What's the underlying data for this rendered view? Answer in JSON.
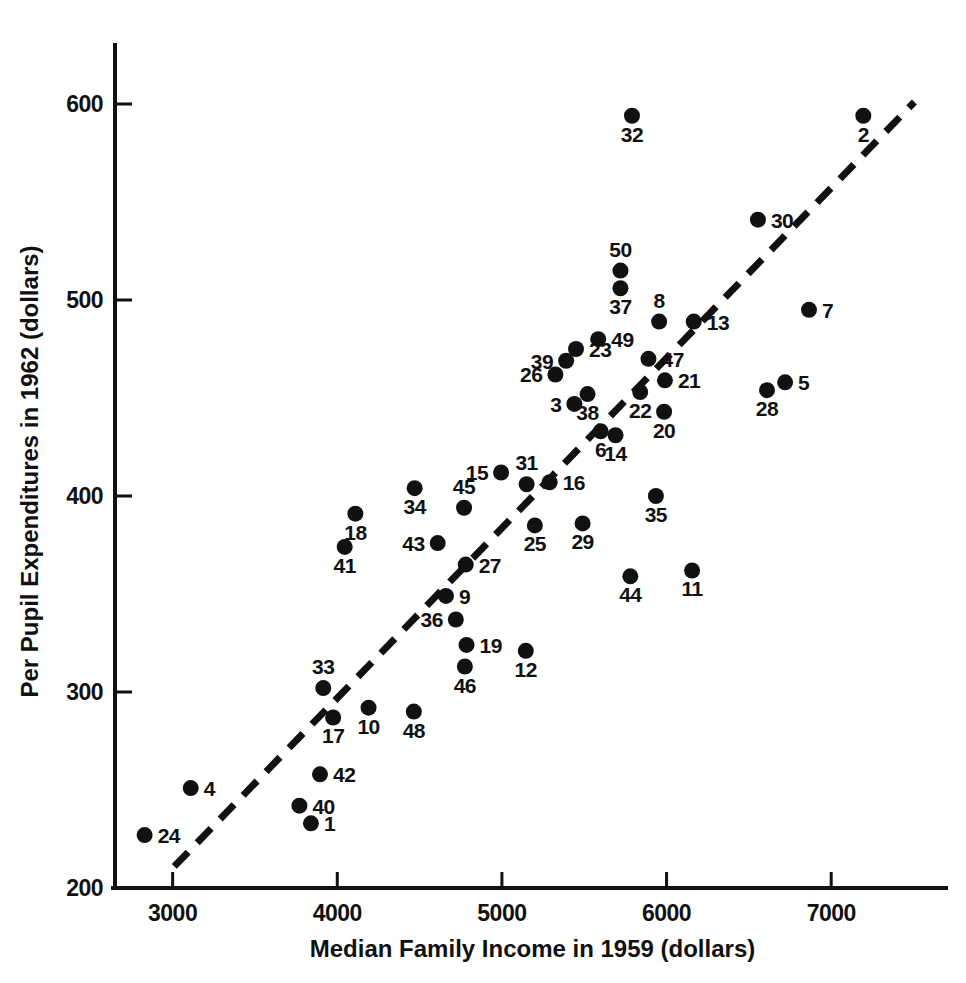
{
  "chart_data": {
    "type": "scatter",
    "title": "",
    "xlabel": "Median Family Income in 1959 (dollars)",
    "ylabel": "Per Pupil Expenditures in 1962 (dollars)",
    "xlim": [
      2650,
      7600
    ],
    "ylim": [
      200,
      625
    ],
    "xticks": [
      3000,
      4000,
      5000,
      6000,
      7000
    ],
    "yticks": [
      200,
      300,
      400,
      500,
      600
    ],
    "xtick_labels": [
      "3000",
      "4000",
      "5000",
      "6000",
      "7000"
    ],
    "ytick_labels": [
      "200",
      "300",
      "400",
      "500",
      "600"
    ],
    "grid": false,
    "legend": "none",
    "marker": "filled-circle",
    "point_label_field": "state_number",
    "fit_line": {
      "style": "dashed",
      "x_start": 3010,
      "y_start": 211,
      "x_end": 7505,
      "y_end": 601
    },
    "points": [
      {
        "label": "24",
        "x": 2830,
        "y": 227
      },
      {
        "label": "4",
        "x": 3110,
        "y": 251
      },
      {
        "label": "40",
        "x": 3770,
        "y": 242
      },
      {
        "label": "1",
        "x": 3840,
        "y": 233
      },
      {
        "label": "42",
        "x": 3895,
        "y": 258
      },
      {
        "label": "33",
        "x": 3915,
        "y": 302
      },
      {
        "label": "17",
        "x": 3975,
        "y": 287
      },
      {
        "label": "10",
        "x": 4190,
        "y": 292
      },
      {
        "label": "41",
        "x": 4045,
        "y": 374
      },
      {
        "label": "18",
        "x": 4110,
        "y": 391
      },
      {
        "label": "48",
        "x": 4465,
        "y": 290
      },
      {
        "label": "34",
        "x": 4470,
        "y": 404
      },
      {
        "label": "43",
        "x": 4610,
        "y": 376
      },
      {
        "label": "9",
        "x": 4660,
        "y": 349
      },
      {
        "label": "36",
        "x": 4720,
        "y": 337
      },
      {
        "label": "45",
        "x": 4770,
        "y": 394
      },
      {
        "label": "27",
        "x": 4780,
        "y": 365
      },
      {
        "label": "46",
        "x": 4775,
        "y": 313
      },
      {
        "label": "19",
        "x": 4785,
        "y": 324
      },
      {
        "label": "15",
        "x": 4995,
        "y": 412
      },
      {
        "label": "12",
        "x": 5145,
        "y": 321
      },
      {
        "label": "31",
        "x": 5150,
        "y": 406
      },
      {
        "label": "16",
        "x": 5290,
        "y": 407
      },
      {
        "label": "25",
        "x": 5200,
        "y": 385
      },
      {
        "label": "29",
        "x": 5490,
        "y": 386
      },
      {
        "label": "26",
        "x": 5325,
        "y": 462
      },
      {
        "label": "39",
        "x": 5390,
        "y": 469
      },
      {
        "label": "3",
        "x": 5440,
        "y": 447
      },
      {
        "label": "23",
        "x": 5450,
        "y": 475
      },
      {
        "label": "38",
        "x": 5520,
        "y": 452
      },
      {
        "label": "49",
        "x": 5585,
        "y": 480
      },
      {
        "label": "6",
        "x": 5600,
        "y": 433
      },
      {
        "label": "50",
        "x": 5720,
        "y": 515
      },
      {
        "label": "37",
        "x": 5720,
        "y": 506
      },
      {
        "label": "14",
        "x": 5690,
        "y": 431
      },
      {
        "label": "44",
        "x": 5780,
        "y": 359
      },
      {
        "label": "32",
        "x": 5790,
        "y": 594
      },
      {
        "label": "47",
        "x": 5890,
        "y": 470
      },
      {
        "label": "22",
        "x": 5840,
        "y": 453
      },
      {
        "label": "35",
        "x": 5935,
        "y": 400
      },
      {
        "label": "8",
        "x": 5955,
        "y": 489
      },
      {
        "label": "21",
        "x": 5990,
        "y": 459
      },
      {
        "label": "20",
        "x": 5985,
        "y": 443
      },
      {
        "label": "11",
        "x": 6155,
        "y": 362
      },
      {
        "label": "13",
        "x": 6165,
        "y": 489
      },
      {
        "label": "30",
        "x": 6555,
        "y": 541
      },
      {
        "label": "28",
        "x": 6610,
        "y": 454
      },
      {
        "label": "5",
        "x": 6720,
        "y": 458
      },
      {
        "label": "7",
        "x": 6865,
        "y": 495
      },
      {
        "label": "2",
        "x": 7195,
        "y": 594
      }
    ],
    "point_label_offsets": {
      "24": "right",
      "4": "right",
      "40": "right",
      "1": "right",
      "42": "right",
      "33": "above",
      "17": "below",
      "10": "below",
      "41": "below",
      "18": "below",
      "48": "below",
      "34": "below",
      "43": "left",
      "9": "right",
      "36": "left",
      "45": "above",
      "27": "right",
      "46": "below",
      "19": "right",
      "15": "left",
      "12": "below",
      "31": "above",
      "16": "right",
      "25": "below",
      "29": "below",
      "26": "left",
      "39": "left",
      "3": "left",
      "23": "right",
      "38": "below",
      "49": "right",
      "6": "below",
      "50": "above",
      "37": "below",
      "14": "below",
      "44": "below",
      "32": "below",
      "47": "right",
      "22": "below",
      "35": "below",
      "8": "above",
      "21": "right",
      "20": "below",
      "11": "below",
      "13": "right",
      "30": "right",
      "28": "below",
      "5": "right",
      "7": "right",
      "2": "below"
    }
  },
  "figure": {
    "caption": ""
  }
}
